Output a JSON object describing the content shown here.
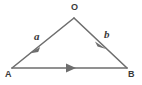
{
  "figure": {
    "kind": "vector-triangle-diagram",
    "background_color": "#ffffff",
    "stroke_color": "#6e6e6e",
    "text_color": "#3a3a3a",
    "stroke_width": 1.6,
    "width": 142,
    "height": 85
  },
  "vertices": [
    {
      "id": "O",
      "label": "O",
      "x": 74,
      "y": 18
    },
    {
      "id": "A",
      "label": "A",
      "x": 12,
      "y": 68
    },
    {
      "id": "B",
      "label": "B",
      "x": 127,
      "y": 68
    }
  ],
  "vectors": [
    {
      "id": "a",
      "label": "a",
      "from": "O",
      "to": "A",
      "arrow_at": "mid",
      "arrow_x": 35,
      "arrow_y": 49,
      "label_x": 34,
      "label_y": 31
    },
    {
      "id": "b",
      "label": "b",
      "from": "O",
      "to": "B",
      "arrow_at": "mid",
      "arrow_x": 101,
      "arrow_y": 44,
      "label_x": 104,
      "label_y": 29
    },
    {
      "id": "AB",
      "label": "",
      "from": "A",
      "to": "B",
      "arrow_at": "mid",
      "arrow_x": 71,
      "arrow_y": 68,
      "label_x": null,
      "label_y": null
    }
  ],
  "labels": {
    "apex": "O",
    "left_vertex": "A",
    "right_vertex": "B",
    "vector_a": "a",
    "vector_b": "b"
  }
}
